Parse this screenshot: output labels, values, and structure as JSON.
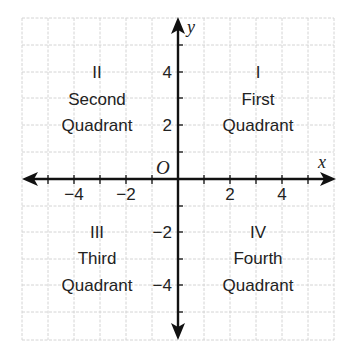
{
  "diagram": {
    "type": "coordinate-plane",
    "axes": {
      "x_label": "x",
      "y_label": "y",
      "origin_label": "O",
      "x_ticks": [
        {
          "value": -4,
          "label": "−4"
        },
        {
          "value": -2,
          "label": "−2"
        },
        {
          "value": 2,
          "label": "2"
        },
        {
          "value": 4,
          "label": "4"
        }
      ],
      "y_ticks": [
        {
          "value": 4,
          "label": "4"
        },
        {
          "value": 2,
          "label": "2"
        },
        {
          "value": -2,
          "label": "−2"
        },
        {
          "value": -4,
          "label": "−4"
        }
      ],
      "range_x": [
        -6,
        6
      ],
      "range_y": [
        -6,
        6
      ]
    },
    "quadrants": [
      {
        "numeral": "I",
        "name": "First",
        "word": "Quadrant"
      },
      {
        "numeral": "II",
        "name": "Second",
        "word": "Quadrant"
      },
      {
        "numeral": "III",
        "name": "Third",
        "word": "Quadrant"
      },
      {
        "numeral": "IV",
        "name": "Fourth",
        "word": "Quadrant"
      }
    ],
    "colors": {
      "axis": "#111111",
      "grid": "#d4d4d4",
      "text": "#222222",
      "background": "#ffffff"
    }
  }
}
